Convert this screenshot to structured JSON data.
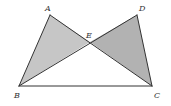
{
  "diagram": {
    "type": "geometry",
    "colors": {
      "stroke": "#333333",
      "shade_left": "#c6c6c6",
      "shade_right": "#b2b2b2",
      "background": "#ffffff"
    },
    "points": {
      "A": {
        "label": "A",
        "x": 50,
        "y": 15,
        "lx": 45,
        "ly": 11
      },
      "D": {
        "label": "D",
        "x": 137,
        "y": 15,
        "lx": 139,
        "ly": 11
      },
      "E": {
        "label": "E",
        "x": 90,
        "y": 42,
        "lx": 86,
        "ly": 38
      },
      "B": {
        "label": "B",
        "x": 19,
        "y": 86,
        "lx": 14,
        "ly": 98
      },
      "C": {
        "label": "C",
        "x": 152,
        "y": 86,
        "lx": 154,
        "ly": 98
      }
    },
    "shaded_triangles": [
      {
        "name": "ABE",
        "fill": "#c6c6c6"
      },
      {
        "name": "EDC",
        "fill": "#b2b2b2"
      }
    ],
    "segments": [
      "AB",
      "AC",
      "BD",
      "DC",
      "BC"
    ]
  }
}
